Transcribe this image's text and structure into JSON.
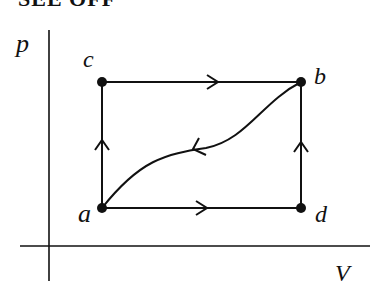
{
  "heading": "SEE OFF",
  "diagram": {
    "type": "pV-diagram",
    "axes": {
      "y_label": "p",
      "x_label": "V"
    },
    "points": [
      {
        "id": "a",
        "label": "a",
        "x": 102,
        "y": 208
      },
      {
        "id": "b",
        "label": "b",
        "x": 301,
        "y": 82
      },
      {
        "id": "c",
        "label": "c",
        "x": 102,
        "y": 82
      },
      {
        "id": "d",
        "label": "d",
        "x": 301,
        "y": 208
      }
    ],
    "paths": [
      {
        "from": "a",
        "to": "c",
        "shape": "straight",
        "direction": "up"
      },
      {
        "from": "c",
        "to": "b",
        "shape": "straight",
        "direction": "right"
      },
      {
        "from": "a",
        "to": "d",
        "shape": "straight",
        "direction": "right"
      },
      {
        "from": "d",
        "to": "b",
        "shape": "straight",
        "direction": "up"
      },
      {
        "from": "b",
        "to": "a",
        "shape": "curve",
        "direction": "left-down"
      }
    ],
    "colors": {
      "ink": "#111111",
      "background": "#ffffff"
    }
  }
}
